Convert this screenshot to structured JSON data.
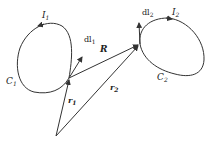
{
  "diagram": {
    "type": "physics-figure",
    "loops": [
      {
        "id": "C1",
        "label": "C",
        "label_sub": "1",
        "current": "I",
        "current_sub": "1",
        "element": "dl",
        "element_sub": "1"
      },
      {
        "id": "C2",
        "label": "C",
        "label_sub": "2",
        "current": "I",
        "current_sub": "2",
        "element": "dl",
        "element_sub": "2"
      }
    ],
    "vectors": [
      {
        "id": "r1",
        "label": "r",
        "label_sub": "1",
        "from": "origin",
        "to": "dl1"
      },
      {
        "id": "r2",
        "label": "r",
        "label_sub": "2",
        "from": "origin",
        "to": "dl2"
      },
      {
        "id": "R",
        "label": "R",
        "from": "dl1",
        "to": "dl2"
      }
    ],
    "colors": {
      "stroke": "#333333",
      "background": "#ffffff"
    }
  }
}
